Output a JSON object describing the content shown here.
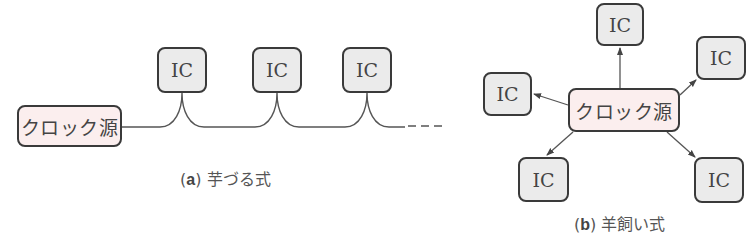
{
  "diagram_a": {
    "clock_label": "クロック源",
    "ic_labels": [
      "IC",
      "IC",
      "IC"
    ],
    "caption_paren_open": "(",
    "caption_letter": "a",
    "caption_paren_close": ")",
    "caption_text": "芋づる式"
  },
  "diagram_b": {
    "clock_label": "クロック源",
    "ic_labels": [
      "IC",
      "IC",
      "IC",
      "IC",
      "IC"
    ],
    "caption_paren_open": "(",
    "caption_letter": "b",
    "caption_paren_close": ")",
    "caption_text": "羊飼い式"
  },
  "colors": {
    "ic_fill": "#ebebeb",
    "clock_fill": "#fbeeee",
    "border": "#3a3a3a",
    "line": "#555555"
  }
}
